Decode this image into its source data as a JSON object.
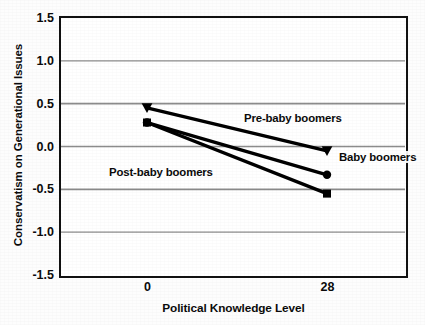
{
  "chart_data": {
    "type": "line",
    "title": "",
    "xlabel": "Political Knowledge Level",
    "ylabel": "Conservatism on Generational Issues",
    "x": [
      0,
      28
    ],
    "categories": [
      "0",
      "28"
    ],
    "xtick_labels": [
      "0",
      "28"
    ],
    "ytick_labels": [
      "1.5",
      "1.0",
      "0.5",
      "0.0",
      "-0.5",
      "-1.0",
      "-1.5"
    ],
    "ytick_values": [
      1.5,
      1.0,
      0.5,
      0.0,
      -0.5,
      -1.0,
      -1.5
    ],
    "ylim": [
      -1.5,
      1.5
    ],
    "xlim": [
      0,
      28
    ],
    "grid": "horizontal",
    "legend_position": "inline-annotations",
    "series": [
      {
        "name": "Pre-baby boomers",
        "marker": "triangle",
        "color": "#000000",
        "values": [
          0.45,
          -0.05
        ]
      },
      {
        "name": "Baby boomers",
        "marker": "circle",
        "color": "#000000",
        "values": [
          0.28,
          -0.33
        ]
      },
      {
        "name": "Post-baby boomers",
        "marker": "square",
        "color": "#000000",
        "values": [
          0.28,
          -0.55
        ]
      }
    ],
    "annotations": [
      {
        "text": "Pre-baby boomers",
        "x_px": 243,
        "y_px": 112
      },
      {
        "text": "Baby boomers",
        "x_px": 338,
        "y_px": 151
      },
      {
        "text": "Post-baby boomers",
        "x_px": 108,
        "y_px": 166
      }
    ]
  },
  "axis": {
    "y_title": "Conservatism on Generational Issues",
    "x_title": "Political Knowledge Level",
    "y_ticks": [
      "1.5",
      "1.0",
      "0.5",
      "0.0",
      "-0.5",
      "-1.0",
      "-1.5"
    ],
    "x_ticks": [
      "0",
      "28"
    ]
  },
  "style": {
    "line_color": "#000000",
    "grid_color": "#8c8c8c",
    "frame_color": "#111111",
    "background": "#ffffff"
  }
}
